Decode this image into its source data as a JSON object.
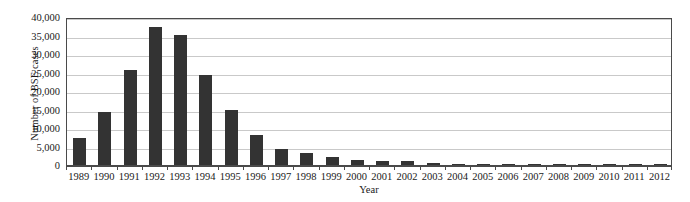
{
  "chart_data": {
    "type": "bar",
    "title": "",
    "xlabel": "Year",
    "ylabel": "Number of BSE cases",
    "categories": [
      "1989",
      "1990",
      "1991",
      "1992",
      "1993",
      "1994",
      "1995",
      "1996",
      "1997",
      "1998",
      "1999",
      "2000",
      "2001",
      "2002",
      "2003",
      "2004",
      "2005",
      "2006",
      "2007",
      "2008",
      "2009",
      "2010",
      "2011",
      "2012"
    ],
    "values": [
      7200,
      14400,
      25700,
      37300,
      35100,
      24400,
      14900,
      8200,
      4400,
      3200,
      2300,
      1400,
      1200,
      1150,
      600,
      350,
      225,
      115,
      60,
      40,
      25,
      15,
      8,
      5
    ],
    "ylim": [
      0,
      40000
    ],
    "ytick_values": [
      0,
      5000,
      10000,
      15000,
      20000,
      25000,
      30000,
      35000,
      40000
    ],
    "ytick_labels": [
      "0",
      "5,000",
      "10,000",
      "15,000",
      "20,000",
      "25,000",
      "30,000",
      "35,000",
      "40,000"
    ],
    "grid": true,
    "legend": false,
    "bar_color": "#333333",
    "gridline_color": "#c9c9c9",
    "frame_color": "#4a4a4a",
    "background_color": "#ffffff"
  }
}
